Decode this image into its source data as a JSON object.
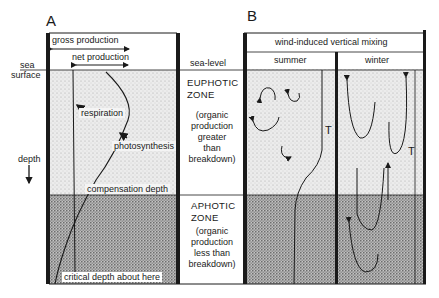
{
  "panel_a": {
    "letter": "A",
    "gross_production": "gross  production",
    "net_production": "net production",
    "sea_surface_line1": "sea",
    "sea_surface_line2": "surface",
    "respiration": "respiration",
    "photosynthesis": "photosynthesis",
    "depth": "depth",
    "compensation_depth": "compensation depth",
    "critical_depth": "critical depth about here"
  },
  "middle": {
    "sea_level": "sea-level",
    "euphotic_title_1": "EUPHOTIC",
    "euphotic_title_2": "ZONE",
    "euphotic_desc": [
      "(organic",
      "production",
      "greater",
      "than",
      "breakdown)"
    ],
    "aphotic_title_1": "APHOTIC",
    "aphotic_title_2": "ZONE",
    "aphotic_desc": [
      "(organic",
      "production",
      "less  than",
      "breakdown)"
    ]
  },
  "panel_b": {
    "letter": "B",
    "header": "wind-induced vertical mixing",
    "summer": "summer",
    "winter": "winter",
    "thermocline_summer": "T",
    "thermocline_winter": "T"
  },
  "colors": {
    "ink": "#1a1a1a",
    "light_stipple": "#e6e6e6",
    "dark_stipple": "#a8a8a8",
    "paper": "#ffffff"
  }
}
